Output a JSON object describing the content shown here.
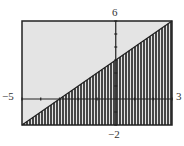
{
  "chart_data": {
    "type": "area",
    "title": "",
    "inequality": "y <= x + 3",
    "boundary": {
      "slope": 1,
      "intercept": 3
    },
    "shade": "below",
    "xlim": [
      -5,
      3
    ],
    "ylim": [
      -2,
      6
    ],
    "xscale": 1,
    "yscale": 1,
    "grid": false,
    "xlabel": "",
    "ylabel": "",
    "window_labels": {
      "xmin": "−5",
      "xmax": "3",
      "ymin": "−2",
      "ymax": "6"
    },
    "points": [
      {
        "x": -5,
        "y": -2
      },
      {
        "x": -3,
        "y": 0
      },
      {
        "x": 0,
        "y": 3
      },
      {
        "x": 3,
        "y": 6
      }
    ]
  },
  "colors": {
    "screen_bg": "#e4e4e4",
    "frame": "#222222",
    "shade": "#1e1e1e",
    "axis": "#222222"
  },
  "layout": {
    "frame": {
      "left": 22,
      "top": 21,
      "right": 172,
      "bottom": 125
    },
    "stripe_period": 3
  }
}
